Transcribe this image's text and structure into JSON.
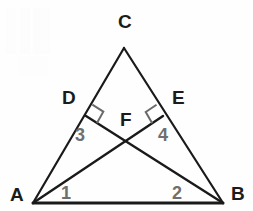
{
  "figure": {
    "background_color": "#fefefe",
    "stroke_color": "#1a1a1a",
    "right_angle_color": "#6a6a6a",
    "vertex_label_color": "#1b1b1b",
    "angle_label_color": "#6f6f6f"
  },
  "points": {
    "A": {
      "label": "A",
      "x": 33,
      "y": 203
    },
    "B": {
      "label": "B",
      "x": 223,
      "y": 203
    },
    "C": {
      "label": "C",
      "x": 124,
      "y": 48
    },
    "D": {
      "label": "D",
      "x": 86,
      "y": 116
    },
    "E": {
      "label": "E",
      "x": 163,
      "y": 116
    },
    "F": {
      "label": "F",
      "x": 128,
      "y": 142
    }
  },
  "vertex_labels": [
    {
      "name": "label-C",
      "text": "C",
      "x": 118,
      "y": 12
    },
    {
      "name": "label-D",
      "text": "D",
      "x": 62,
      "y": 88
    },
    {
      "name": "label-E",
      "text": "E",
      "x": 172,
      "y": 88
    },
    {
      "name": "label-F",
      "text": "F",
      "x": 120,
      "y": 110
    },
    {
      "name": "label-A",
      "text": "A",
      "x": 10,
      "y": 185
    },
    {
      "name": "label-B",
      "text": "B",
      "x": 231,
      "y": 184
    }
  ],
  "angle_labels": [
    {
      "name": "angle-1",
      "text": "1",
      "x": 61,
      "y": 184
    },
    {
      "name": "angle-2",
      "text": "2",
      "x": 172,
      "y": 184
    },
    {
      "name": "angle-3",
      "text": "3",
      "x": 75,
      "y": 126
    },
    {
      "name": "angle-4",
      "text": "4",
      "x": 158,
      "y": 126
    }
  ],
  "segments": [
    {
      "name": "segment-AB",
      "from": "A",
      "to": "B",
      "width": 3.0
    },
    {
      "name": "segment-AC",
      "from": "A",
      "to": "C",
      "width": 2.2
    },
    {
      "name": "segment-BC",
      "from": "B",
      "to": "C",
      "width": 2.2
    },
    {
      "name": "segment-AE",
      "from": "A",
      "to": "E",
      "width": 2.4
    },
    {
      "name": "segment-BD",
      "from": "B",
      "to": "D",
      "width": 2.4
    }
  ],
  "right_angles": [
    {
      "name": "right-angle-at-D",
      "at": "D",
      "between": [
        "C",
        "B"
      ],
      "size": 13
    },
    {
      "name": "right-angle-at-E",
      "at": "E",
      "between": [
        "C",
        "A"
      ],
      "size": 13
    }
  ]
}
